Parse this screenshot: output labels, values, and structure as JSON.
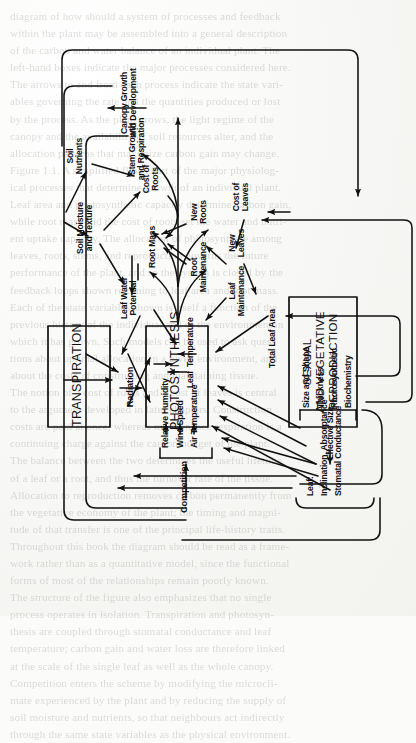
{
  "page": {
    "kind": "scanned-book-page-figure",
    "orientation": "diagram rotated 90 degrees counter-clockwise on the page",
    "background_color": "#fbfbfa",
    "ink_color": "#111111"
  },
  "diagram": {
    "process_boxes": [
      {
        "id": "transpiration",
        "label": "TRANSPIRATION"
      },
      {
        "id": "photosynthesis",
        "label": "PHOTOSYNTHESIS"
      },
      {
        "id": "reproduction",
        "label": "SEXUAL\nAND VEGETATIVE\nREPRODUCTION"
      }
    ],
    "driver_labels": [
      {
        "id": "competition",
        "label": "Competition"
      },
      {
        "id": "relative-humidity",
        "label": "Relative Humidity"
      },
      {
        "id": "wind-speed",
        "label": "Wind Speed"
      },
      {
        "id": "air-temperature",
        "label": "Air Temperature"
      },
      {
        "id": "radiation",
        "label": "Radiation"
      },
      {
        "id": "soil-moisture",
        "label": "Soil Moisture\nand Texture"
      },
      {
        "id": "soil-nutrients",
        "label": "Soil\nNutrients"
      }
    ],
    "state_labels": [
      {
        "id": "leaf-water-potential",
        "label": "Leaf Water\nPotential"
      },
      {
        "id": "leaf-temperature",
        "label": "Leaf  Temperature"
      },
      {
        "id": "root-mass",
        "label": "Root Mass"
      },
      {
        "id": "cost-of-roots",
        "label": "Cost of\nRoots"
      },
      {
        "id": "root-maintenance",
        "label": "Root\nMaintenance"
      },
      {
        "id": "new-roots",
        "label": "New\nRoots"
      },
      {
        "id": "leaf-maintenance",
        "label": "Leaf\nMaintenance"
      },
      {
        "id": "new-leaves",
        "label": "New\nLeaves"
      },
      {
        "id": "cost-of-leaves",
        "label": "Cost of\nLeaves"
      },
      {
        "id": "total-leaf-area",
        "label": "Total Leaf Area"
      },
      {
        "id": "stem-growth",
        "label": "Stem Growth\nand Respiration"
      },
      {
        "id": "canopy-growth",
        "label": "Canopy Growth\nand Development"
      },
      {
        "id": "effective-size",
        "label": "Effective Size"
      }
    ],
    "bracket_groups": [
      {
        "id": "leaf-properties",
        "lines": [
          "Leaf:",
          "Inclination, Absorptance",
          "Stomatal Conductance"
        ]
      },
      {
        "id": "leaf-structure",
        "lines": [
          "Size and Shape",
          "Thickness",
          "Photosynthetic",
          "Biochemistry"
        ]
      },
      {
        "id": "microclimate",
        "lines": [
          "Relative Humidity",
          "Wind Speed",
          "Air Temperature"
        ]
      }
    ]
  },
  "ghost_text": {
    "lines": [
      "diagram of how should a system of processes and feedback",
      "within the plant may be assembled into a general description",
      "of the carbon and water balance of an individual plant. The",
      "left-hand boxes indicate the major processes considered here.",
      "The arrows to and from each process indicate the state vari-",
      "ables governing the rate and the quantities produced or lost",
      "by the process. As the plant grows, the light regime of the",
      "canopy and the availability of soil resources alter, and the",
      "allocation patterns that maximize carbon gain may change.",
      "Figure 1.1. A simplified flow chart of the major physiolog-",
      "ical processes that determine growth of an individual plant.",
      "Leaf area and photosynthetic capacity determine carbon gain,",
      "while root mass and the cost of roots set the water and nutri-",
      "ent uptake capacity. The allocation of photosynthate among",
      "leaves, roots, stems, and reproduction governs the future",
      "performance of the plant, and so the system is closed by the",
      "feedback loops shown returning to leaf area and root mass.",
      "Each of the state variables shown is itself a function of the",
      "previous history of the individual and of the environment in",
      "which it has grown. Such models can be used to ask ques-",
      "tions about optimal allocation in a given environment, and",
      "about the costs of constructing and maintaining tissue.",
      "The notion of a cost of roots and a cost of leaves is central",
      "to the argument developed in later chapters. Construction",
      "costs are paid at once, whereas maintenance respiration is a",
      "continuing charge against the carbon budget of the plant.",
      "The balance between the two determines the useful lifetime",
      "of a leaf or a root, and thus the turnover rate of the tissue.",
      "Allocation to reproduction removes carbon permanently from",
      "the vegetative economy of the plant; the timing and magni-",
      "tude of that transfer is one of the principal life-history traits.",
      "Throughout this book the diagram should be read as a frame-",
      "work rather than as a quantitative model, since the functional",
      "forms of most of the relationships remain poorly known.",
      "The structure of the figure also emphasizes that no single",
      "process operates in isolation. Transpiration and photosyn-",
      "thesis are coupled through stomatal conductance and leaf",
      "temperature; carbon gain and water loss are therefore linked",
      "at the scale of the single leaf as well as the whole canopy.",
      "Competition enters the scheme by modifying the microcli-",
      "mate experienced by the plant and by reducing the supply of",
      "soil moisture and nutrients, so that neighbours act indirectly",
      "through the same state variables as the physical environment."
    ]
  }
}
